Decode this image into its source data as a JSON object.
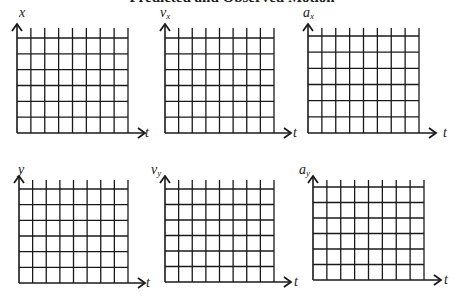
{
  "title": "Predicted and Observed Motion",
  "graphs": [
    {
      "id": "x",
      "y_label": "x",
      "y_sub": "",
      "x_label": "t",
      "left": 17,
      "top": 24,
      "right": 128,
      "bottom": 133,
      "first_row": 38
    },
    {
      "id": "vx",
      "y_label": "v",
      "y_sub": "x",
      "x_label": "t",
      "left": 165,
      "top": 24,
      "right": 274,
      "bottom": 133,
      "first_row": 38
    },
    {
      "id": "ax",
      "y_label": "a",
      "y_sub": "x",
      "x_label": "t",
      "left": 308,
      "top": 24,
      "right": 419,
      "bottom": 133,
      "first_row": 36
    },
    {
      "id": "y",
      "y_label": "y",
      "y_sub": "",
      "x_label": "t",
      "left": 19,
      "top": 176,
      "right": 128,
      "bottom": 283,
      "first_row": 189
    },
    {
      "id": "vy",
      "y_label": "v",
      "y_sub": "y",
      "x_label": "t",
      "left": 165,
      "top": 176,
      "right": 274,
      "bottom": 282,
      "first_row": 189
    },
    {
      "id": "ay",
      "y_label": "a",
      "y_sub": "y",
      "x_label": "t",
      "left": 313,
      "top": 176,
      "right": 424,
      "bottom": 280,
      "first_row": 187
    }
  ],
  "grid": {
    "columns": 8,
    "rows": 6,
    "line_color": "#1a1a1a"
  }
}
